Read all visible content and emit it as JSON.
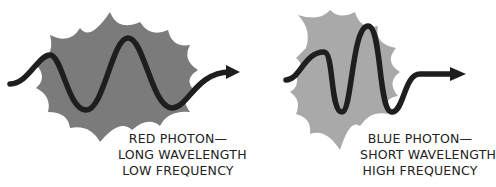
{
  "diagram": {
    "colors": {
      "red_blob": "#7b7b7b",
      "blue_blob": "#a9a9a9",
      "wave": "#1e1e1e",
      "text": "#222222",
      "background": "#ffffff"
    },
    "photons": [
      {
        "id": "red",
        "caption": [
          "RED PHOTON—",
          "LONG WAVELENGTH",
          "LOW FREQUENCY"
        ]
      },
      {
        "id": "blue",
        "caption": [
          "BLUE PHOTON—",
          "SHORT WAVELENGTH",
          "HIGH FREQUENCY"
        ]
      }
    ]
  }
}
